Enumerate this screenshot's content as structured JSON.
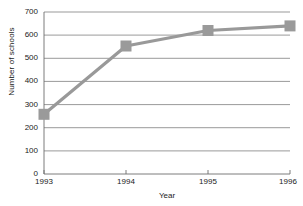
{
  "chart_data": {
    "type": "line",
    "title": "",
    "xlabel": "Year",
    "ylabel": "Number of schools",
    "categories": [
      "1993",
      "1994",
      "1995",
      "1996"
    ],
    "values": [
      258,
      553,
      620,
      640
    ],
    "series": [
      {
        "name": "Number of schools",
        "values": [
          258,
          553,
          620,
          640
        ]
      }
    ],
    "ylim": [
      0,
      700
    ],
    "yticks": [
      0,
      100,
      200,
      300,
      400,
      500,
      600,
      700
    ],
    "ytick_labels": [
      "0",
      "100",
      "200",
      "300",
      "400",
      "500",
      "600",
      "700"
    ],
    "xtick_labels": [
      "1993",
      "1994",
      "1995",
      "1996"
    ],
    "grid": "horizontal",
    "legend": "none",
    "marker": "square",
    "colors": {
      "line": "#999999",
      "marker": "#9a9a9a",
      "grid": "#6e6e6e",
      "axis": "#6e6e6e",
      "text": "#1a1a1a",
      "background": "#ffffff"
    }
  }
}
